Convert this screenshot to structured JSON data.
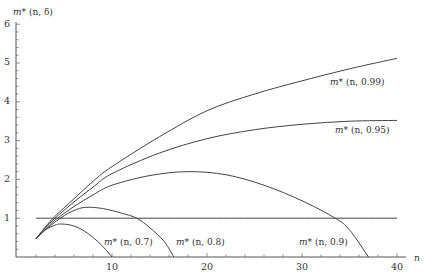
{
  "chart_data": {
    "type": "line",
    "title": "",
    "xlabel": "n",
    "ylabel": "m* (n, δ)",
    "xlim": [
      0,
      41
    ],
    "ylim": [
      0,
      6
    ],
    "grid": false,
    "x_ticks": [
      10,
      20,
      30,
      40
    ],
    "y_ticks": [
      1,
      2,
      3,
      4,
      5,
      6
    ],
    "series": [
      {
        "name": "m* (n, 0.99)",
        "label": "m* (n, 0.99)",
        "x": [
          2,
          3,
          4,
          6,
          8,
          10,
          15,
          20,
          25,
          30,
          35,
          40
        ],
        "values": [
          0.47,
          0.78,
          1.05,
          1.5,
          1.95,
          2.33,
          3.1,
          3.77,
          4.2,
          4.54,
          4.85,
          5.12
        ]
      },
      {
        "name": "m* (n, 0.95)",
        "label": "m* (n, 0.95)",
        "x": [
          2,
          3,
          4,
          6,
          8,
          10,
          15,
          20,
          25,
          30,
          35,
          40
        ],
        "values": [
          0.47,
          0.76,
          1.0,
          1.42,
          1.8,
          2.15,
          2.68,
          3.05,
          3.28,
          3.42,
          3.5,
          3.52
        ]
      },
      {
        "name": "m* (n, 0.9)",
        "label": "m* (n, 0.9)",
        "x": [
          2,
          3,
          4,
          6,
          8,
          10,
          14,
          18,
          22,
          26,
          30,
          33.5,
          35,
          37
        ],
        "values": [
          0.47,
          0.72,
          0.95,
          1.3,
          1.6,
          1.85,
          2.1,
          2.2,
          2.12,
          1.85,
          1.45,
          1.0,
          0.7,
          0.0
        ]
      },
      {
        "name": "m* (n, 0.8)",
        "label": "m* (n, 0.8)",
        "x": [
          2,
          3,
          4,
          5,
          6,
          7.2,
          9,
          11,
          12.6,
          14,
          15.5,
          16.5
        ],
        "values": [
          0.47,
          0.7,
          0.9,
          1.07,
          1.2,
          1.28,
          1.25,
          1.13,
          1.0,
          0.75,
          0.4,
          0.0
        ]
      },
      {
        "name": "m* (n, 0.7)",
        "label": "m* (n, 0.7)",
        "x": [
          2,
          3,
          4,
          4.5,
          5.5,
          6.5,
          7.5,
          8.5,
          9.3,
          10
        ],
        "values": [
          0.47,
          0.7,
          0.82,
          0.85,
          0.83,
          0.75,
          0.6,
          0.4,
          0.2,
          0.0
        ]
      },
      {
        "name": "threshold",
        "label": "",
        "x": [
          2,
          40
        ],
        "values": [
          1,
          1
        ]
      }
    ],
    "annotations": [
      "m* (n, 0.99)",
      "m* (n, 0.95)",
      "m* (n, 0.9)",
      "m* (n, 0.8)",
      "m* (n, 0.7)"
    ]
  },
  "axes": {
    "ylabel_m": "m*",
    "ylabel_args": "(n, δ)",
    "xlabel": "n",
    "xticks": [
      "10",
      "20",
      "30",
      "40"
    ],
    "yticks": [
      "1",
      "2",
      "3",
      "4",
      "5",
      "6"
    ]
  },
  "labels": {
    "d099": {
      "m": "m*",
      "args": "(n, 0.99)"
    },
    "d095": {
      "m": "m*",
      "args": "(n, 0.95)"
    },
    "d09": {
      "m": "m*",
      "args": "(n, 0.9)"
    },
    "d08": {
      "m": "m*",
      "args": "(n, 0.8)"
    },
    "d07": {
      "m": "m*",
      "args": "(n, 0.7)"
    }
  }
}
